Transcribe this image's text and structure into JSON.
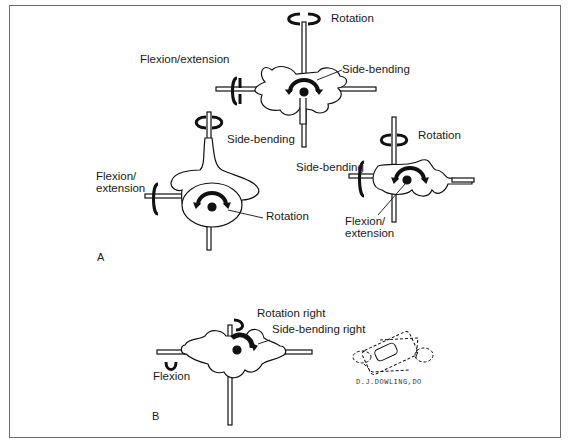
{
  "figure": {
    "panels": [
      {
        "id": "A",
        "label": "A",
        "views": [
          {
            "name": "posterior-oblique-vertebra",
            "labels": {
              "rotation": "Rotation",
              "flexion_extension": "Flexion/extension",
              "side_bending": "Side-bending"
            }
          },
          {
            "name": "superior-vertebra-view",
            "labels": {
              "side_bending": "Side-bending",
              "flexion_extension_line1": "Flexion/",
              "flexion_extension_line2": "extension",
              "rotation": "Rotation"
            }
          },
          {
            "name": "lateral-vertebra-view",
            "labels": {
              "rotation": "Rotation",
              "side_bending": "Side-bending",
              "flexion_extension_line1": "Flexion/",
              "flexion_extension_line2": "extension"
            }
          }
        ]
      },
      {
        "id": "B",
        "label": "B",
        "views": [
          {
            "name": "combined-motion-vertebra",
            "labels": {
              "rotation_right": "Rotation right",
              "side_bending_right": "Side-bending right",
              "flexion": "Flexion"
            }
          },
          {
            "name": "signature-sketch",
            "labels": {
              "signature": "D.J.DOWLING,DO"
            }
          }
        ]
      }
    ]
  }
}
